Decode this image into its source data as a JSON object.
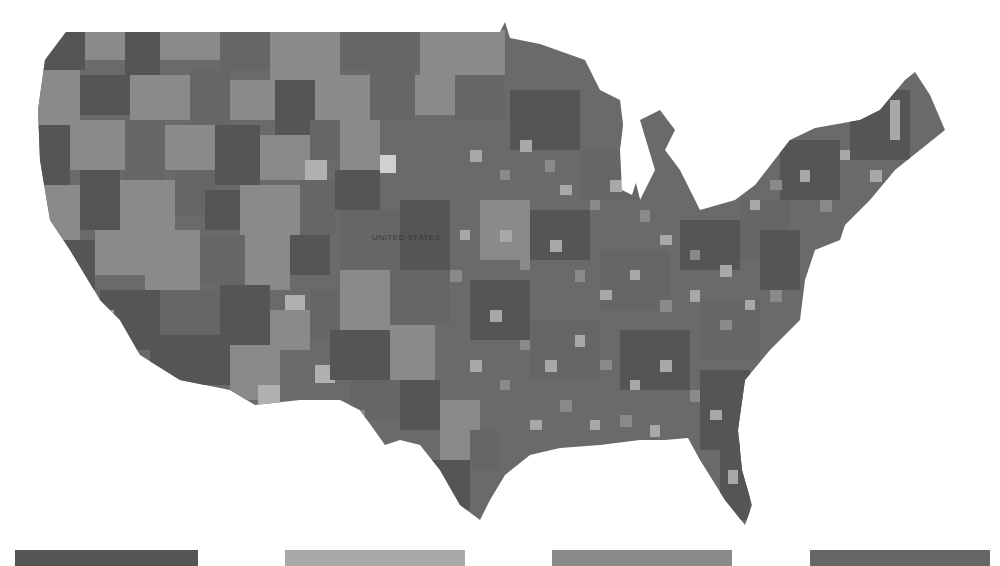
{
  "map": {
    "type": "choropleth",
    "region": "Contiguous United States",
    "granularity": "county",
    "center_label": "UNITED STATES",
    "palette": [
      "#555555",
      "#a8a8a8",
      "#8a8a8a",
      "#666666"
    ],
    "background": "#ffffff"
  },
  "legend": {
    "swatches": [
      {
        "color": "#555555",
        "label": ""
      },
      {
        "color": "#a8a8a8",
        "label": ""
      },
      {
        "color": "#8a8a8a",
        "label": ""
      },
      {
        "color": "#666666",
        "label": ""
      }
    ]
  }
}
